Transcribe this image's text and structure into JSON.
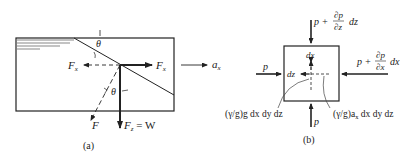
{
  "figure_a": {
    "caption": "(a)",
    "angle_top": "θ",
    "angle_mid": "θ",
    "force_left": "F",
    "force_left_sub": "x",
    "force_right": "F",
    "force_right_sub": "x",
    "force_down": "F",
    "force_down_sub": "z",
    "force_down_eq": " = W",
    "force_resultant": "F",
    "accel": "a",
    "accel_sub": "x"
  },
  "figure_b": {
    "caption": "(b)",
    "top_p": "p +",
    "top_num": "∂p",
    "top_den": "∂z",
    "top_d": "dz",
    "right_p": "p +",
    "right_num": "∂p",
    "right_den": "∂x",
    "right_d": "dx",
    "left_p": "p",
    "bottom_p": "p",
    "inner_dx": "dx",
    "inner_dz": "dz",
    "weight_label": "(γ/g)g dx dy dz",
    "inertia_label_a": "(γ/g)a",
    "inertia_label_sub": "x",
    "inertia_label_b": " dx dy dz"
  }
}
